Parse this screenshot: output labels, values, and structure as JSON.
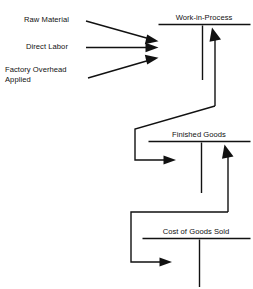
{
  "diagram": {
    "type": "t-account-cost-flow",
    "title_visible": false,
    "canvas": {
      "width": 253,
      "height": 289
    },
    "ink_color": "#111111",
    "background_color": "#ffffff",
    "inputs": [
      {
        "id": "raw-material",
        "label": "Raw Material",
        "lines": [
          "Raw Material"
        ]
      },
      {
        "id": "direct-labor",
        "label": "Direct Labor",
        "lines": [
          "Direct Labor"
        ]
      },
      {
        "id": "factory-overhead-applied",
        "label": "Factory Overhead Applied",
        "lines": [
          "Factory Overhead",
          "Applied"
        ]
      }
    ],
    "accounts": [
      {
        "id": "work-in-process",
        "title": "Work-in-Process"
      },
      {
        "id": "finished-goods",
        "title": "Finished Goods"
      },
      {
        "id": "cost-of-goods-sold",
        "title": "Cost of Goods Sold"
      }
    ],
    "flows": [
      {
        "from": "raw-material",
        "to": "work-in-process",
        "side": "debit"
      },
      {
        "from": "direct-labor",
        "to": "work-in-process",
        "side": "debit"
      },
      {
        "from": "factory-overhead-applied",
        "to": "work-in-process",
        "side": "debit"
      },
      {
        "from": "work-in-process",
        "to": "finished-goods",
        "side": "credit-to-debit"
      },
      {
        "from": "finished-goods",
        "to": "cost-of-goods-sold",
        "side": "credit-to-debit"
      }
    ]
  }
}
